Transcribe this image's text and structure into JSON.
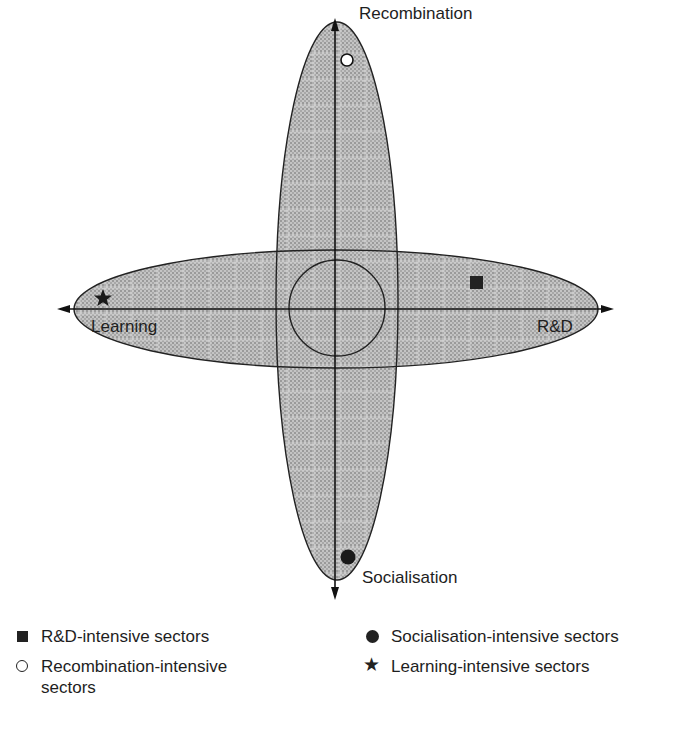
{
  "diagram": {
    "title": "",
    "axes": {
      "top": "Recombination",
      "left": "Learning",
      "right": "R&D",
      "bottom": "Socialisation"
    },
    "markers": [
      {
        "type": "open-circle",
        "label": "Recombination-intensive sectors",
        "quadrant": "top"
      },
      {
        "type": "filled-square",
        "label": "R&D-intensive sectors",
        "quadrant": "right"
      },
      {
        "type": "filled-circle",
        "label": "Socialisation-intensive sectors",
        "quadrant": "bottom"
      },
      {
        "type": "star",
        "label": "Learning-intensive sectors",
        "quadrant": "left"
      }
    ],
    "colors": {
      "fill": "#b9b9b9",
      "stroke": "#222222",
      "background": "#ffffff"
    }
  },
  "legend": {
    "items": [
      {
        "symbol": "square",
        "label": "R&D-intensive sectors"
      },
      {
        "symbol": "open-circle",
        "label": "Recombination-intensive sectors"
      },
      {
        "symbol": "filled-circle",
        "label": "Socialisation-intensive sectors"
      },
      {
        "symbol": "star",
        "label": "Learning-intensive sectors"
      }
    ]
  }
}
